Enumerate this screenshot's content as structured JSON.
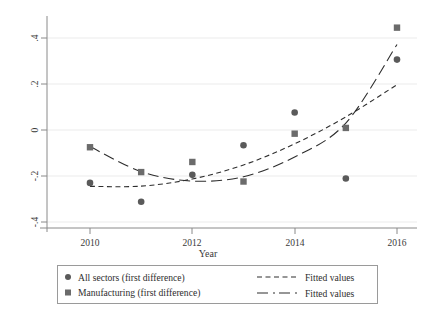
{
  "chart_data": {
    "type": "scatter",
    "title": "",
    "xlabel": "Year",
    "ylabel": "",
    "xlim": [
      2009.35,
      2016.5
    ],
    "ylim": [
      -0.44,
      0.48
    ],
    "xticks": [
      2010,
      2012,
      2014,
      2016
    ],
    "xtick_labels": [
      "2010",
      "2012",
      "2014",
      "2016"
    ],
    "yticks": [
      -0.4,
      -0.2,
      0,
      0.2,
      0.4
    ],
    "ytick_labels": [
      "-.4",
      "-.2",
      "0",
      ".2",
      ".4"
    ],
    "grid": "horizontal",
    "legend_position": "below-plot",
    "x": [
      2010,
      2011,
      2012,
      2013,
      2014,
      2015,
      2016
    ],
    "series": [
      {
        "name": "All sectors (first difference)",
        "marker": "circle",
        "color": "#5a5a5a",
        "values": [
          -0.23,
          -0.312,
          -0.195,
          -0.066,
          0.076,
          -0.211,
          0.306
        ]
      },
      {
        "name": "Manufacturing (first difference)",
        "marker": "square",
        "color": "#6b6b6b",
        "values": [
          -0.075,
          -0.183,
          -0.139,
          -0.224,
          -0.016,
          0.009,
          0.445
        ]
      },
      {
        "name": "Fitted values",
        "marker": "short-dash-line",
        "color": "#2e2e2e",
        "fit_for": "All sectors (first difference)",
        "values": [
          -0.245,
          -0.244,
          -0.213,
          -0.152,
          -0.06,
          0.057,
          0.197
        ]
      },
      {
        "name": "Fitted values",
        "marker": "long-dash-line",
        "color": "#2e2e2e",
        "fit_for": "Manufacturing (first difference)",
        "values": [
          -0.072,
          -0.181,
          -0.222,
          -0.203,
          -0.117,
          0.03,
          0.372
        ]
      }
    ]
  },
  "axis": {
    "x_title": "Year",
    "y_title": ""
  },
  "legend": {
    "entries": [
      {
        "label": "All sectors (first difference)",
        "glyph": "circle-marker"
      },
      {
        "label": "Manufacturing (first difference)",
        "glyph": "square-marker"
      },
      {
        "label": "Fitted values",
        "glyph": "short-dash-line"
      },
      {
        "label": "Fitted values",
        "glyph": "long-dash-line"
      }
    ]
  },
  "colors": {
    "marker_circle": "#5a5a5a",
    "marker_square": "#6b6b6b",
    "line": "#2e2e2e",
    "axis": "#8a8a8a",
    "grid": "#ebebeb",
    "legend_border": "#9a9a9a",
    "background": "#ffffff"
  }
}
